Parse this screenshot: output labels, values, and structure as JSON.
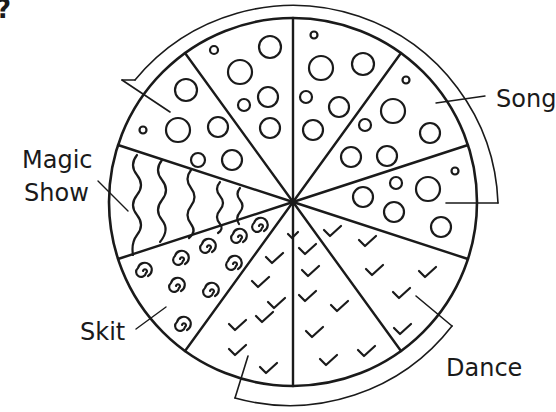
{
  "title_fragment": "?",
  "diagram": {
    "type": "pie-pictogram",
    "total_slices": 10,
    "center": [
      293,
      202
    ],
    "radius": 184,
    "stroke_color": "#1a1a1a",
    "background": "#ffffff"
  },
  "labels": {
    "song": "Song",
    "magic_show_line1": "Magic",
    "magic_show_line2": "Show",
    "skit": "Skit",
    "dance": "Dance"
  },
  "categories": [
    {
      "name": "Song",
      "slices": 5,
      "pattern": "circles"
    },
    {
      "name": "Magic Show",
      "slices": 1,
      "pattern": "wavy-lines"
    },
    {
      "name": "Skit",
      "slices": 1,
      "pattern": "spirals"
    },
    {
      "name": "Dance",
      "slices": 3,
      "pattern": "check-marks"
    }
  ]
}
